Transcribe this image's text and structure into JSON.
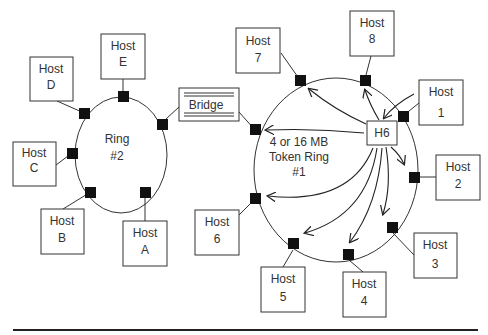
{
  "diagram": {
    "type": "network-topology",
    "ring2": {
      "label_line1": "Ring",
      "label_line2": "#2",
      "hosts": [
        {
          "id": "E",
          "line1": "Host",
          "line2": "E"
        },
        {
          "id": "D",
          "line1": "Host",
          "line2": "D"
        },
        {
          "id": "C",
          "line1": "Host",
          "line2": "C"
        },
        {
          "id": "B",
          "line1": "Host",
          "line2": "B"
        },
        {
          "id": "A",
          "line1": "Host",
          "line2": "A"
        }
      ]
    },
    "bridge": {
      "label": "Bridge"
    },
    "ring1": {
      "label_line1": "4 or 16 MB",
      "label_line2": "Token Ring",
      "label_line3": "#1",
      "sender": "H6",
      "hosts": [
        {
          "id": "7",
          "line1": "Host",
          "line2": "7"
        },
        {
          "id": "8",
          "line1": "Host",
          "line2": "8"
        },
        {
          "id": "1",
          "line1": "Host",
          "line2": "1"
        },
        {
          "id": "2",
          "line1": "Host",
          "line2": "2"
        },
        {
          "id": "3",
          "line1": "Host",
          "line2": "3"
        },
        {
          "id": "4",
          "line1": "Host",
          "line2": "4"
        },
        {
          "id": "5",
          "line1": "Host",
          "line2": "5"
        },
        {
          "id": "6",
          "line1": "Host",
          "line2": "6"
        }
      ]
    }
  }
}
